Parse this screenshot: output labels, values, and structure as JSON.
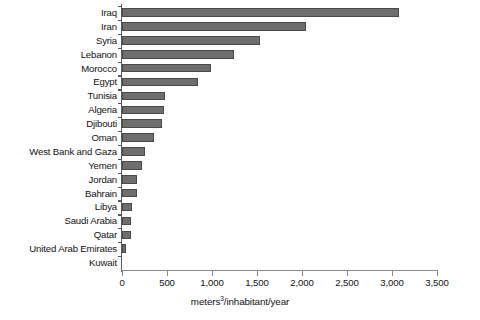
{
  "chart_data": {
    "type": "bar",
    "orientation": "horizontal",
    "title": "",
    "xlabel": "meters3/inhabitant/year",
    "xlabel_parts": {
      "prefix": "meters",
      "superscript": "3",
      "suffix": "/inhabitant/year"
    },
    "ylabel": "",
    "xlim": [
      0,
      3500
    ],
    "xticks": [
      0,
      500,
      1000,
      1500,
      2000,
      2500,
      3000,
      3500
    ],
    "xtick_labels": [
      "0",
      "500",
      "1,000",
      "1,500",
      "2,000",
      "2,500",
      "3,000",
      "3,500"
    ],
    "grid": false,
    "legend": null,
    "bar_color": "#6e6e6e",
    "bar_edge_color": "#4a4a4a",
    "axis_color": "#595959",
    "categories": [
      "Iraq",
      "Iran",
      "Syria",
      "Lebanon",
      "Morocco",
      "Egypt",
      "Tunisia",
      "Algeria",
      "Djibouti",
      "Oman",
      "West Bank and Gaza",
      "Yemen",
      "Jordan",
      "Bahrain",
      "Libya",
      "Saudi Arabia",
      "Qatar",
      "United Arab Emirates",
      "Kuwait"
    ],
    "values": [
      3080,
      2040,
      1530,
      1240,
      990,
      840,
      480,
      465,
      445,
      360,
      260,
      220,
      165,
      165,
      110,
      95,
      100,
      40,
      0
    ]
  }
}
